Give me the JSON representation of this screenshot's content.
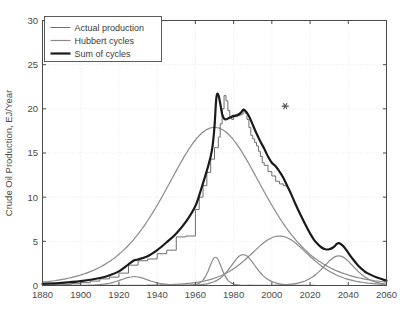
{
  "chart_data": {
    "type": "line",
    "title": "",
    "xlabel": "",
    "ylabel": "Crude Oil Production, EJ/Year",
    "xlim": [
      1880,
      2060
    ],
    "ylim": [
      0,
      30
    ],
    "xticks": [
      1880,
      1900,
      1920,
      1940,
      1960,
      1980,
      2000,
      2020,
      2040,
      2060
    ],
    "yticks": [
      0,
      5,
      10,
      15,
      20,
      25,
      30
    ],
    "grid": true,
    "legend_position": "upper-left",
    "legend": [
      {
        "label": "Actual production",
        "color": "#6e6e6e",
        "width": 1.0,
        "style": "step"
      },
      {
        "label": "Hubbert cycles",
        "color": "#8a8a8a",
        "width": 1.2,
        "style": "smooth"
      },
      {
        "label": "Sum of cycles",
        "color": "#1a1a1a",
        "width": 2.2,
        "style": "smooth"
      }
    ],
    "annotations": [
      {
        "name": "asterisk-marker",
        "symbol": "*",
        "x": 2007,
        "y": 20.3,
        "color": "#555555"
      }
    ],
    "series": [
      {
        "name": "Actual production",
        "style": "step",
        "color": "#6e6e6e",
        "x": [
          1880,
          1885,
          1890,
          1895,
          1900,
          1905,
          1910,
          1915,
          1920,
          1925,
          1930,
          1935,
          1940,
          1945,
          1950,
          1955,
          1960,
          1962,
          1964,
          1966,
          1968,
          1970,
          1971,
          1972,
          1973,
          1974,
          1975,
          1976,
          1977,
          1978,
          1979,
          1980,
          1981,
          1982,
          1983,
          1984,
          1985,
          1986,
          1987,
          1988,
          1989,
          1990,
          1991,
          1992,
          1993,
          1994,
          1995,
          1996,
          1998,
          2000,
          2002,
          2004,
          2006,
          2008
        ],
        "y": [
          0.05,
          0.08,
          0.13,
          0.2,
          0.32,
          0.5,
          0.75,
          0.95,
          1.4,
          2.3,
          2.8,
          3.0,
          3.6,
          4.0,
          5.5,
          5.6,
          8.6,
          10.0,
          11.3,
          12.8,
          14.3,
          15.6,
          15.6,
          16.8,
          18.3,
          20.0,
          21.5,
          20.9,
          19.8,
          19.0,
          18.8,
          19.1,
          19.1,
          19.2,
          19.3,
          19.4,
          19.8,
          19.5,
          18.8,
          17.9,
          17.0,
          16.6,
          16.2,
          15.8,
          15.2,
          14.6,
          13.9,
          13.6,
          12.9,
          12.4,
          11.8,
          11.5,
          11.3,
          11.2
        ]
      },
      {
        "name": "Hubbert cycle 1 (early, 1960s broad)",
        "style": "smooth",
        "color": "#8a8a8a",
        "peak_year": 1970,
        "peak_value": 17.9,
        "width_years": 62
      },
      {
        "name": "Hubbert cycle 2 (1928 small)",
        "style": "smooth",
        "color": "#8a8a8a",
        "peak_year": 1928,
        "peak_value": 1.0,
        "width_years": 18
      },
      {
        "name": "Hubbert cycle 3 (1970 narrow spike)",
        "style": "smooth",
        "color": "#8a8a8a",
        "peak_year": 1970.5,
        "peak_value": 3.2,
        "width_years": 8
      },
      {
        "name": "Hubbert cycle 4 (1985)",
        "style": "smooth",
        "color": "#8a8a8a",
        "peak_year": 1985,
        "peak_value": 3.5,
        "width_years": 16
      },
      {
        "name": "Hubbert cycle 5 (2004 broad)",
        "style": "smooth",
        "color": "#8a8a8a",
        "peak_year": 2004,
        "peak_value": 5.6,
        "width_years": 38
      },
      {
        "name": "Hubbert cycle 6 (2035)",
        "style": "smooth",
        "color": "#8a8a8a",
        "peak_year": 2035,
        "peak_value": 3.35,
        "width_years": 20
      },
      {
        "name": "Sum of cycles",
        "style": "smooth",
        "color": "#1a1a1a",
        "x": [
          1880,
          1890,
          1900,
          1910,
          1915,
          1920,
          1925,
          1928,
          1930,
          1935,
          1940,
          1945,
          1950,
          1955,
          1960,
          1963,
          1966,
          1968,
          1969,
          1970,
          1971,
          1972,
          1973,
          1974,
          1975,
          1976,
          1977,
          1978,
          1980,
          1982,
          1984,
          1985,
          1986,
          1988,
          1990,
          1992,
          1994,
          1996,
          1998,
          2000,
          2002,
          2004,
          2006,
          2008,
          2010,
          2012,
          2015,
          2018,
          2020,
          2022,
          2024,
          2026,
          2028,
          2030,
          2032,
          2034,
          2035,
          2036,
          2038,
          2040,
          2042,
          2045,
          2048,
          2050,
          2055,
          2060
        ],
        "y": [
          0.18,
          0.3,
          0.5,
          0.85,
          1.15,
          1.6,
          2.4,
          2.85,
          2.95,
          3.3,
          4.0,
          4.9,
          5.9,
          7.2,
          9.0,
          10.9,
          13.0,
          14.6,
          15.8,
          18.0,
          21.3,
          21.6,
          20.6,
          19.4,
          18.9,
          18.8,
          18.9,
          19.0,
          19.2,
          19.3,
          19.6,
          19.9,
          19.8,
          19.2,
          18.2,
          17.2,
          16.3,
          15.5,
          14.6,
          13.9,
          13.5,
          12.9,
          12.2,
          11.3,
          10.4,
          9.4,
          8.0,
          6.7,
          5.9,
          5.2,
          4.7,
          4.3,
          4.1,
          4.1,
          4.3,
          4.7,
          4.8,
          4.7,
          4.3,
          3.7,
          3.1,
          2.3,
          1.7,
          1.4,
          0.9,
          0.55
        ]
      }
    ]
  },
  "axis": {
    "y_title": "Crude Oil Production, EJ/Year",
    "x_tick_labels": [
      "1880",
      "1900",
      "1920",
      "1940",
      "1960",
      "1980",
      "2000",
      "2020",
      "2040",
      "2060"
    ],
    "y_tick_labels": [
      "0",
      "5",
      "10",
      "15",
      "20",
      "25",
      "30"
    ]
  },
  "legend": {
    "items": [
      {
        "label": "Actual production"
      },
      {
        "label": "Hubbert cycles"
      },
      {
        "label": "Sum of cycles"
      }
    ]
  },
  "colors": {
    "background": "#ffffff",
    "axis": "#4a4a4a",
    "grid": "#d8d8d8",
    "actual": "#6e6e6e",
    "hubbert": "#8a8a8a",
    "sum": "#1a1a1a",
    "marker": "#555555"
  }
}
